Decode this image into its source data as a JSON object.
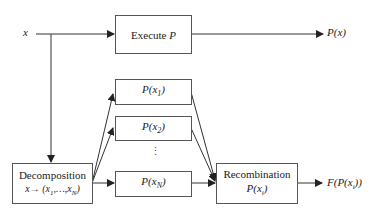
{
  "diagram": {
    "input_label": "x",
    "execute_box": {
      "label": "Execute",
      "symbol": "P"
    },
    "output_label": "P(x)",
    "sub_boxes": [
      {
        "label": "P(x1)",
        "text": "P(",
        "var": "x",
        "sub": "1",
        "close": ")"
      },
      {
        "label": "P(x2)",
        "text": "P(",
        "var": "x",
        "sub": "2",
        "close": ")"
      },
      {
        "label": "P(xN)",
        "text": "P(",
        "var": "x",
        "sub": "N",
        "close": ")"
      }
    ],
    "ellipsis": "⋮",
    "decomposition_box": {
      "title": "Decomposition",
      "mapping": "x→ (x1,…,xN)",
      "map_x": "x→ (",
      "map_x1": "x",
      "map_sub1": "1",
      "map_mid": ",…,",
      "map_xN": "x",
      "map_subN": "N",
      "map_close": ")"
    },
    "recombination_box": {
      "title": "Recombination",
      "formula": "P(xi)",
      "f_open": "P(",
      "f_var": "x",
      "f_sub": "i",
      "f_close": ")"
    },
    "final_output": {
      "label": "F(P(xi))",
      "open": "F(P(",
      "var": "x",
      "sub": "i",
      "close": "))"
    },
    "colors": {
      "line": "#333333",
      "box_border": "#555555",
      "background": "#ffffff"
    }
  }
}
